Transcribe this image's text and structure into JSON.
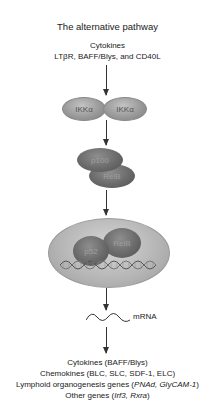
{
  "title": "The alternative pathway",
  "inputs": {
    "line1": "Cytokines",
    "line2": "LTβR, BAFF/Blys, and CD40L"
  },
  "kinase_complex": {
    "left": "IKKα",
    "right": "IKKα"
  },
  "precursor_complex": {
    "top": "p100",
    "bottom": "RelB"
  },
  "nuclear_complex": {
    "left": "p52",
    "right": "RelB",
    "dna_label": "DNA"
  },
  "transcript": {
    "label": "mRNA"
  },
  "outputs": {
    "cytokines": "Cytokines (BAFF/Blys)",
    "chemokines": "Chemokines (BLC, SLC, SDF-1, ELC)",
    "lymphoid_prefix": "Lymphoid organogenesis genes (",
    "lymphoid_genes": "PNAd, GlyCAM-1",
    "lymphoid_suffix": ")",
    "other_prefix": "Other genes (",
    "other_genes": "Irf3, Rxra",
    "other_suffix": ")"
  },
  "colors": {
    "ikk_fill": "#9a9a9a",
    "dark_protein_fill": "#6a6a6a",
    "nucleus_fill": "#b4b4b4",
    "arrow": "#333333",
    "text": "#222222"
  }
}
